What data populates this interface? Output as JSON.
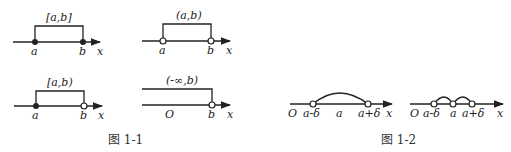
{
  "figure_1_1": {
    "caption": "图 1-1",
    "panels": [
      {
        "interval": "[a,b]",
        "left": "a",
        "right": "b",
        "axis": "x"
      },
      {
        "interval": "(a,b)",
        "left": "a",
        "right": "b",
        "axis": "x"
      },
      {
        "interval": "[a,b)",
        "left": "a",
        "right": "b",
        "axis": "x"
      },
      {
        "interval": "(-∞,b)",
        "origin": "O",
        "right": "b",
        "axis": "x"
      }
    ]
  },
  "figure_1_2": {
    "caption": "图 1-2",
    "panels": [
      {
        "origin": "O",
        "left": "a-δ",
        "center": "a",
        "right": "a+δ",
        "axis": "x"
      },
      {
        "origin": "O",
        "left": "a-δ",
        "center": "a",
        "right": "a+δ",
        "axis": "x"
      }
    ]
  }
}
